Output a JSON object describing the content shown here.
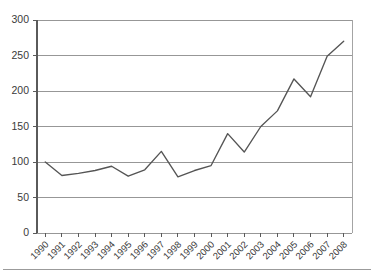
{
  "chart_data": {
    "type": "line",
    "title": "",
    "subtitle": "",
    "xlabel": "",
    "ylabel": "",
    "categories": [
      "1990",
      "1991",
      "1992",
      "1993",
      "1994",
      "1995",
      "1996",
      "1997",
      "1998",
      "1999",
      "2000",
      "2001",
      "2002",
      "2003",
      "2004",
      "2005",
      "2006",
      "2007",
      "2008"
    ],
    "values": [
      100,
      81,
      84,
      88,
      94,
      80,
      89,
      115,
      79,
      88,
      95,
      140,
      114,
      150,
      172,
      217,
      192,
      249,
      270
    ],
    "series": [
      {
        "name": "Index",
        "values": [
          100,
          81,
          84,
          88,
          94,
          80,
          89,
          115,
          79,
          88,
          95,
          140,
          114,
          150,
          172,
          217,
          192,
          249,
          270
        ],
        "color": "#555555"
      }
    ],
    "ylim": [
      0,
      300
    ],
    "ytick_values": [
      0,
      50,
      100,
      150,
      200,
      250,
      300
    ],
    "ytick_labels": [
      "0",
      "50",
      "100",
      "150",
      "200",
      "250",
      "300"
    ],
    "xtick_labels": [
      "1990",
      "1991",
      "1992",
      "1993",
      "1994",
      "1995",
      "1996",
      "1997",
      "1998",
      "1999",
      "2000",
      "2001",
      "2002",
      "2003",
      "2004",
      "2005",
      "2006",
      "2007",
      "2008"
    ],
    "grid": "horizontal",
    "legend": "none",
    "xlabel_rotation": -45,
    "colors": {
      "line": "#555555",
      "grid": "#8c8c8c",
      "axis": "#5a5a5a",
      "text": "#3a3a3a",
      "background": "#ffffff"
    }
  }
}
